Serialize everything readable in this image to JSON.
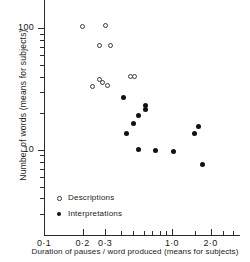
{
  "chart_data": {
    "type": "scatter",
    "title": "",
    "xlabel": "Duration of pauses / word produced (means for subjects)",
    "ylabel": "Number of words (means for subjects)",
    "xscale": "log",
    "yscale": "log",
    "xlim": [
      0.1,
      3.4
    ],
    "ylim": [
      2.0,
      170
    ],
    "grid": false,
    "legend_position": "lower-left-inside",
    "x_tick_labels": [
      {
        "value": 0.1,
        "label": "0·1"
      },
      {
        "value": 0.2,
        "label": "0·2"
      },
      {
        "value": 0.3,
        "label": "0·3"
      },
      {
        "value": 1.0,
        "label": "1·0"
      },
      {
        "value": 2.0,
        "label": "2·0"
      }
    ],
    "x_minor_ticks": [
      0.4,
      0.5,
      0.6,
      0.7,
      0.8,
      0.9,
      1.5,
      2.5,
      3.0
    ],
    "y_tick_labels": [
      {
        "value": 100,
        "label": "100"
      },
      {
        "value": 10,
        "label": "10"
      }
    ],
    "y_minor_ticks": [
      90,
      80,
      70,
      60,
      50,
      40,
      30,
      20,
      9,
      8,
      7,
      6,
      5,
      4,
      3
    ],
    "series": [
      {
        "name": "Descriptions",
        "marker": "open-circle",
        "color": "#3a3a3a",
        "points": [
          {
            "x": 0.2,
            "y": 103
          },
          {
            "x": 0.3,
            "y": 104
          },
          {
            "x": 0.27,
            "y": 72
          },
          {
            "x": 0.33,
            "y": 72
          },
          {
            "x": 0.24,
            "y": 33
          },
          {
            "x": 0.27,
            "y": 38
          },
          {
            "x": 0.285,
            "y": 36
          },
          {
            "x": 0.315,
            "y": 34
          },
          {
            "x": 0.47,
            "y": 40
          },
          {
            "x": 0.51,
            "y": 40
          }
        ]
      },
      {
        "name": "Interpretations",
        "marker": "filled-circle",
        "color": "#111111",
        "points": [
          {
            "x": 0.42,
            "y": 27
          },
          {
            "x": 0.62,
            "y": 23
          },
          {
            "x": 0.62,
            "y": 21.5
          },
          {
            "x": 0.545,
            "y": 19
          },
          {
            "x": 0.5,
            "y": 16.5
          },
          {
            "x": 0.445,
            "y": 13.5
          },
          {
            "x": 0.55,
            "y": 10
          },
          {
            "x": 0.74,
            "y": 9.8
          },
          {
            "x": 1.02,
            "y": 9.7
          },
          {
            "x": 1.5,
            "y": 13.5
          },
          {
            "x": 1.62,
            "y": 15.5
          },
          {
            "x": 1.72,
            "y": 7.6
          }
        ]
      }
    ]
  },
  "legend": {
    "items": [
      {
        "label": "Descriptions",
        "marker": "open-circle"
      },
      {
        "label": "Interpretations",
        "marker": "filled-circle"
      }
    ]
  }
}
